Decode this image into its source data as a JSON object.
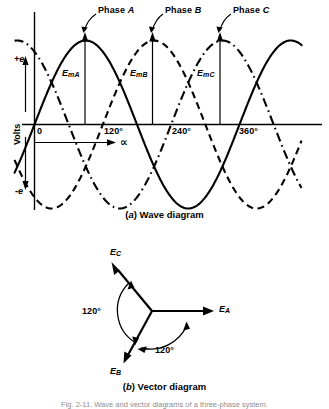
{
  "figure": {
    "title_caption": "Fig. 2-11. Wave and vector diagrams of a three-phase system.",
    "panel_a_caption_prefix": "(",
    "panel_a_caption_letter": "a",
    "panel_a_caption_suffix": ") Wave diagram",
    "panel_b_caption_letter": "b",
    "panel_b_caption_suffix": ") Vector diagram"
  },
  "wave_diagram": {
    "caption": "(a) Wave diagram",
    "y_axis_label": "Volts",
    "y_tick_positive": "+e",
    "y_tick_negative": "-e",
    "x_axis_symbol": "∝",
    "x_origin_label": "0",
    "x_ticks": [
      "120°",
      "240°",
      "360°"
    ],
    "curve_labels": [
      "Phase A",
      "Phase B",
      "Phase C"
    ],
    "amplitude_labels": [
      "EmA",
      "EmB",
      "EmC"
    ],
    "amplitude_label_base": "E",
    "amplitude_label_subs": [
      "mA",
      "mB",
      "mC"
    ],
    "phase_label_base": "Phase",
    "phase_label_letters": [
      "A",
      "B",
      "C"
    ],
    "ink_color": "#000000"
  },
  "vector_diagram": {
    "caption": "(b) Vector diagram",
    "vectors": [
      {
        "name": "EA",
        "base": "E",
        "sub": "A",
        "angle_deg": 0
      },
      {
        "name": "EB",
        "base": "E",
        "sub": "B",
        "angle_deg": 240
      },
      {
        "name": "EC",
        "base": "E",
        "sub": "C",
        "angle_deg": 120
      }
    ],
    "angle_labels": [
      "120°",
      "120°"
    ],
    "ink_color": "#000000"
  },
  "chart_data": {
    "type": "line",
    "title": "(a) Wave diagram",
    "xlabel": "∝",
    "ylabel": "Volts",
    "xlim": [
      -30,
      450
    ],
    "ylim": [
      -1,
      1
    ],
    "x_ticks": [
      0,
      120,
      240,
      360
    ],
    "x_tick_labels": [
      "0",
      "120°",
      "240°",
      "360°"
    ],
    "y_ticks": [
      -1,
      1
    ],
    "y_tick_labels": [
      "-e",
      "+e"
    ],
    "grid": false,
    "legend": "inline-annotation",
    "series": [
      {
        "name": "Phase A",
        "phase_deg": 0,
        "amplitude": 1,
        "style": "solid",
        "peak_deg": 90,
        "label": "EmA"
      },
      {
        "name": "Phase B",
        "phase_deg": 120,
        "amplitude": 1,
        "style": "dashed",
        "peak_deg": 210,
        "label": "EmB"
      },
      {
        "name": "Phase C",
        "phase_deg": 240,
        "amplitude": 1,
        "style": "dash-dot",
        "peak_deg": 330,
        "label": "EmC"
      }
    ]
  }
}
